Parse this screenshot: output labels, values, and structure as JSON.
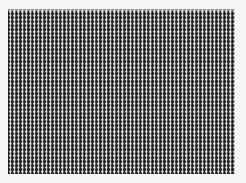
{
  "image": {
    "subject": "dense woven grid mesh pattern",
    "background_color": "#f6f6f6",
    "pattern_color_dark": "#141414",
    "pattern_color_light": "#f0f0f0",
    "pattern_mid_tone": "#8a8a8a"
  }
}
